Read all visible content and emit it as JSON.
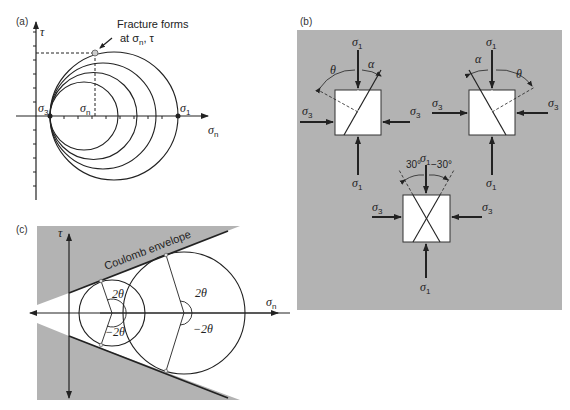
{
  "panels": {
    "a": {
      "label": "(a)",
      "y_axis": "τ",
      "x_axis": "σ",
      "x_axis_sub": "n",
      "sigma3": "σ",
      "sigma3_sub": "3",
      "sigma1": "σ",
      "sigma1_sub": "1",
      "sigma_n": "σ",
      "sigma_n_sub": "n",
      "annotation_line1": "Fracture forms",
      "annotation_line2": "at σ",
      "annotation_sub": "n",
      "annotation_tail": ", τ"
    },
    "b": {
      "label": "(b)",
      "sigma1": "σ",
      "sigma1_sub": "1",
      "sigma3": "σ",
      "sigma3_sub": "3",
      "theta": "θ",
      "alpha": "α",
      "angle_pos": "30°",
      "angle_neg": "−30°"
    },
    "c": {
      "label": "(c)",
      "y_axis": "τ",
      "x_axis": "σ",
      "x_axis_sub": "n",
      "envelope_label": "Coulomb envelope",
      "angle_pos": "2θ",
      "angle_neg": "−2θ"
    }
  },
  "colors": {
    "gray_fill": "#b3b3b3",
    "line": "#222222",
    "white": "#ffffff"
  }
}
